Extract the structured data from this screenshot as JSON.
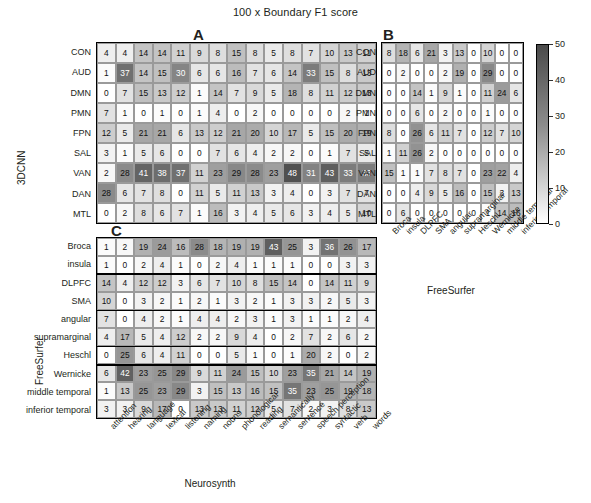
{
  "figure": {
    "title": "100 x Boundary F1 score",
    "panels": [
      "A",
      "B",
      "C"
    ],
    "axis_titles": {
      "left_top": "3DCNN",
      "left_bottom": "FreeSurfer",
      "bottom_left": "Neurosynth",
      "bottom_right": "FreeSurfer"
    }
  },
  "colorbar": {
    "ticks": [
      "50",
      "40",
      "30",
      "20",
      "10",
      "0"
    ],
    "min": 0,
    "max": 50,
    "low_color": "#ffffff",
    "high_color": "#4a4a4a"
  },
  "chart_data": [
    {
      "type": "heatmap",
      "panel": "A",
      "title": "100 x Boundary F1 score",
      "xlabel": "Neurosynth",
      "ylabel": "3DCNN",
      "zlim": [
        0,
        50
      ],
      "grid": true,
      "xticklabels": [
        "attention",
        "hearing",
        "language",
        "lexical",
        "listening",
        "naming",
        "nouns",
        "phonological",
        "reading",
        "semantically",
        "sentence",
        "speech perception",
        "syntactic",
        "verb",
        "words"
      ],
      "yticklabels": [
        "CON",
        "AUD",
        "DMN",
        "PMN",
        "FPN",
        "SAL",
        "VAN",
        "DAN",
        "MTL"
      ],
      "values": [
        [
          4,
          4,
          14,
          14,
          11,
          9,
          8,
          15,
          8,
          5,
          8,
          7,
          10,
          13,
          11
        ],
        [
          1,
          37,
          14,
          15,
          30,
          6,
          6,
          16,
          7,
          6,
          14,
          33,
          15,
          8,
          13
        ],
        [
          0,
          7,
          15,
          13,
          12,
          1,
          14,
          7,
          9,
          5,
          18,
          8,
          11,
          12,
          13
        ],
        [
          7,
          1,
          0,
          1,
          0,
          1,
          4,
          0,
          2,
          0,
          0,
          0,
          0,
          2,
          1
        ],
        [
          12,
          5,
          21,
          21,
          6,
          13,
          12,
          21,
          20,
          10,
          17,
          5,
          15,
          20,
          19
        ],
        [
          3,
          1,
          5,
          6,
          0,
          0,
          7,
          6,
          4,
          2,
          2,
          0,
          1,
          7,
          5
        ],
        [
          2,
          28,
          41,
          38,
          37,
          11,
          23,
          29,
          28,
          23,
          48,
          31,
          43,
          33,
          33
        ],
        [
          28,
          6,
          7,
          8,
          0,
          11,
          5,
          11,
          13,
          3,
          4,
          0,
          3,
          7,
          7
        ],
        [
          0,
          2,
          8,
          6,
          7,
          1,
          16,
          3,
          4,
          5,
          6,
          3,
          4,
          5,
          10
        ]
      ]
    },
    {
      "type": "heatmap",
      "panel": "B",
      "xlabel": "FreeSurfer",
      "ylabel": "3DCNN",
      "zlim": [
        0,
        50
      ],
      "grid": true,
      "xticklabels": [
        "Broca",
        "insula",
        "DLPFC",
        "SMA",
        "angular",
        "supramarginal",
        "Heschl",
        "Wernicke",
        "middle temporal",
        "inferior temporal"
      ],
      "yticklabels": [
        "CON",
        "AUD",
        "DMN",
        "PMN",
        "FPN",
        "SAL",
        "VAN",
        "DAN",
        "MTL"
      ],
      "values": [
        [
          8,
          18,
          6,
          21,
          3,
          13,
          0,
          10,
          0,
          0
        ],
        [
          0,
          2,
          0,
          0,
          2,
          19,
          0,
          29,
          0,
          0
        ],
        [
          0,
          0,
          14,
          1,
          9,
          1,
          0,
          11,
          24,
          6
        ],
        [
          0,
          0,
          6,
          0,
          2,
          0,
          0,
          1,
          0,
          0
        ],
        [
          8,
          0,
          26,
          6,
          11,
          7,
          0,
          12,
          7,
          10
        ],
        [
          1,
          11,
          26,
          2,
          0,
          0,
          0,
          0,
          0,
          0
        ],
        [
          15,
          1,
          1,
          7,
          8,
          7,
          0,
          23,
          22,
          4
        ],
        [
          0,
          0,
          4,
          9,
          5,
          16,
          0,
          15,
          3,
          13
        ],
        [
          0,
          6,
          0,
          0,
          0,
          0,
          0,
          1,
          14,
          16
        ]
      ]
    },
    {
      "type": "heatmap",
      "panel": "C",
      "xlabel": "Neurosynth",
      "ylabel": "FreeSurfer",
      "zlim": [
        0,
        50
      ],
      "grid": true,
      "xticklabels": [
        "attention",
        "hearing",
        "language",
        "lexical",
        "listening",
        "naming",
        "nouns",
        "phonological",
        "reading",
        "semantically",
        "sentence",
        "speech perception",
        "syntactic",
        "verb",
        "words"
      ],
      "yticklabels": [
        "Broca",
        "insula",
        "DLPFC",
        "SMA",
        "angular",
        "supramarginal",
        "Heschl",
        "Wernicke",
        "middle temporal",
        "inferior temporal"
      ],
      "values": [
        [
          1,
          2,
          19,
          24,
          16,
          28,
          18,
          19,
          19,
          43,
          25,
          3,
          36,
          26,
          17
        ],
        [
          1,
          0,
          2,
          4,
          1,
          0,
          2,
          4,
          1,
          1,
          1,
          0,
          0,
          3,
          3
        ],
        [
          14,
          4,
          12,
          12,
          3,
          6,
          7,
          10,
          8,
          15,
          14,
          0,
          14,
          11,
          9
        ],
        [
          10,
          0,
          3,
          2,
          1,
          2,
          1,
          3,
          2,
          1,
          3,
          3,
          2,
          5,
          3
        ],
        [
          7,
          0,
          4,
          2,
          1,
          4,
          4,
          2,
          3,
          1,
          3,
          1,
          1,
          2,
          4
        ],
        [
          4,
          17,
          5,
          4,
          12,
          2,
          2,
          9,
          4,
          0,
          2,
          7,
          2,
          6,
          2
        ],
        [
          0,
          25,
          6,
          4,
          11,
          0,
          0,
          5,
          1,
          0,
          1,
          20,
          2,
          0,
          2
        ],
        [
          6,
          42,
          23,
          25,
          29,
          9,
          11,
          24,
          15,
          10,
          23,
          35,
          21,
          14,
          19
        ],
        [
          1,
          13,
          25,
          23,
          29,
          3,
          15,
          13,
          16,
          15,
          35,
          23,
          25,
          19,
          18
        ],
        [
          3,
          3,
          9,
          17,
          0,
          13,
          13,
          11,
          12,
          5,
          7,
          2,
          3,
          8,
          13
        ]
      ]
    }
  ]
}
